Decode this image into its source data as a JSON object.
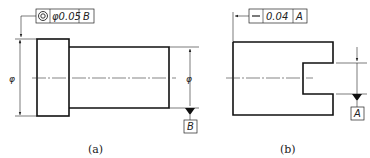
{
  "figure_a": {
    "caption": "(a)",
    "fcf": {
      "symbol": "concentricity-icon",
      "tolerance": "φ0.05",
      "datum": "B"
    },
    "datum_label": "B",
    "diameter_symbol_left": "φ",
    "diameter_symbol_right": "φ"
  },
  "figure_b": {
    "caption": "(b)",
    "fcf": {
      "symbol": "straightness-icon",
      "tolerance": "0.04",
      "datum": "A"
    },
    "datum_label": "A"
  }
}
